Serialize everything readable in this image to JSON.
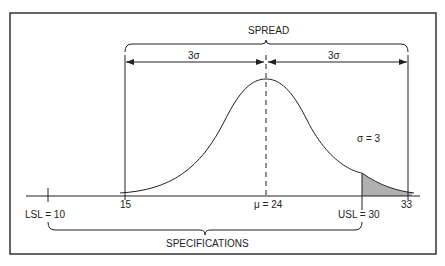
{
  "diagram": {
    "spread_label": "SPREAD",
    "left_sigma_label": "3σ",
    "right_sigma_label": "3σ",
    "sigma_value_label": "σ = 3",
    "specifications_label": "SPECIFICATIONS",
    "ticks": {
      "lsl": "LSL = 10",
      "lower_spread": "15",
      "mean": "μ = 24",
      "usl": "USL = 30",
      "upper_spread": "33"
    },
    "colors": {
      "line": "#222222",
      "shade": "#b0b0b0",
      "border": "#333333"
    }
  }
}
